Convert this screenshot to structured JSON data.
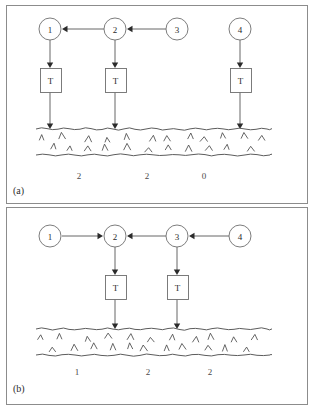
{
  "figure": {
    "width": 313,
    "height": 409,
    "background_color": "#ffffff",
    "frame_color": "#8c8c8c",
    "ink_color": "#2b2b2b"
  },
  "panels": [
    {
      "id": "panel-a",
      "caption": "(a)",
      "frame": {
        "x": 6,
        "y": 5,
        "width": 301,
        "height": 198
      },
      "nodes": [
        {
          "id": "a-node-1",
          "label": "1",
          "cx": 50,
          "cy": 29,
          "r": 11
        },
        {
          "id": "a-node-2",
          "label": "2",
          "cx": 115,
          "cy": 29,
          "r": 11
        },
        {
          "id": "a-node-3",
          "label": "3",
          "cx": 177,
          "cy": 29,
          "r": 11
        },
        {
          "id": "a-node-4",
          "label": "4",
          "cx": 240,
          "cy": 29,
          "r": 11
        }
      ],
      "horizontal_arrows": [
        {
          "id": "a-arrow-3-to-2",
          "from": "3",
          "to": "2",
          "direction": "left",
          "x_start": 166,
          "x_end": 127,
          "y": 29
        },
        {
          "id": "a-arrow-2-to-1",
          "from": "2",
          "to": "1",
          "direction": "left",
          "x_start": 104,
          "x_end": 62,
          "y": 29
        }
      ],
      "tboxes": [
        {
          "id": "a-tbox-1",
          "label": "T",
          "x": 40,
          "y": 68,
          "width": 21,
          "height": 24
        },
        {
          "id": "a-tbox-2",
          "label": "T",
          "x": 105,
          "y": 68,
          "width": 21,
          "height": 24
        },
        {
          "id": "a-tbox-4",
          "label": "T",
          "x": 230,
          "y": 68,
          "width": 21,
          "height": 24
        }
      ],
      "vertical_arrows": [
        {
          "id": "a-varrow-node1-tbox",
          "x": 50,
          "y_start": 40,
          "y_end": 68
        },
        {
          "id": "a-varrow-node2-tbox",
          "x": 115,
          "y_start": 40,
          "y_end": 68
        },
        {
          "id": "a-varrow-node4-tbox",
          "x": 240,
          "y_start": 40,
          "y_end": 68
        },
        {
          "id": "a-varrow-tbox1-ground",
          "x": 50,
          "y_start": 92,
          "y_end": 129
        },
        {
          "id": "a-varrow-tbox2-ground",
          "x": 115,
          "y_start": 92,
          "y_end": 129
        },
        {
          "id": "a-varrow-tbox4-ground",
          "x": 240,
          "y_start": 92,
          "y_end": 129
        }
      ],
      "ground": {
        "x_start": 36,
        "x_end": 272,
        "y_top": 129,
        "y_bottom": 155
      },
      "counts": [
        {
          "id": "a-count-1",
          "value": "2",
          "x": 79,
          "y": 176
        },
        {
          "id": "a-count-2",
          "value": "2",
          "x": 147,
          "y": 176
        },
        {
          "id": "a-count-3",
          "value": "0",
          "x": 204,
          "y": 176
        }
      ],
      "caption_pos": {
        "x": 13,
        "y": 190
      }
    },
    {
      "id": "panel-b",
      "caption": "(b)",
      "frame": {
        "x": 6,
        "y": 207,
        "width": 301,
        "height": 197
      },
      "nodes": [
        {
          "id": "b-node-1",
          "label": "1",
          "cx": 50,
          "cy": 236,
          "r": 11
        },
        {
          "id": "b-node-2",
          "label": "2",
          "cx": 115,
          "cy": 236,
          "r": 11
        },
        {
          "id": "b-node-3",
          "label": "3",
          "cx": 177,
          "cy": 236,
          "r": 11
        },
        {
          "id": "b-node-4",
          "label": "4",
          "cx": 240,
          "cy": 236,
          "r": 11
        }
      ],
      "horizontal_arrows": [
        {
          "id": "b-arrow-1-to-2",
          "from": "1",
          "to": "2",
          "direction": "right",
          "x_start": 62,
          "x_end": 103,
          "y": 236
        },
        {
          "id": "b-arrow-3-to-2",
          "from": "3",
          "to": "2",
          "direction": "left",
          "x_start": 166,
          "x_end": 127,
          "y": 236
        },
        {
          "id": "b-arrow-4-to-3",
          "from": "4",
          "to": "3",
          "direction": "left",
          "x_start": 229,
          "x_end": 189,
          "y": 236
        }
      ],
      "tboxes": [
        {
          "id": "b-tbox-2",
          "label": "T",
          "x": 105,
          "y": 275,
          "width": 21,
          "height": 24
        },
        {
          "id": "b-tbox-3",
          "label": "T",
          "x": 167,
          "y": 275,
          "width": 21,
          "height": 24
        }
      ],
      "vertical_arrows": [
        {
          "id": "b-varrow-node2-tbox",
          "x": 115,
          "y_start": 247,
          "y_end": 275
        },
        {
          "id": "b-varrow-node3-tbox",
          "x": 177,
          "y_start": 247,
          "y_end": 275
        },
        {
          "id": "b-varrow-tbox2-ground",
          "x": 115,
          "y_start": 299,
          "y_end": 329
        },
        {
          "id": "b-varrow-tbox3-ground",
          "x": 177,
          "y_start": 299,
          "y_end": 329
        }
      ],
      "ground": {
        "x_start": 36,
        "x_end": 272,
        "y_top": 329,
        "y_bottom": 355
      },
      "counts": [
        {
          "id": "b-count-1",
          "value": "1",
          "x": 77,
          "y": 372
        },
        {
          "id": "b-count-2",
          "value": "2",
          "x": 148,
          "y": 372
        },
        {
          "id": "b-count-3",
          "value": "2",
          "x": 210,
          "y": 372
        }
      ],
      "caption_pos": {
        "x": 13,
        "y": 388
      }
    }
  ]
}
